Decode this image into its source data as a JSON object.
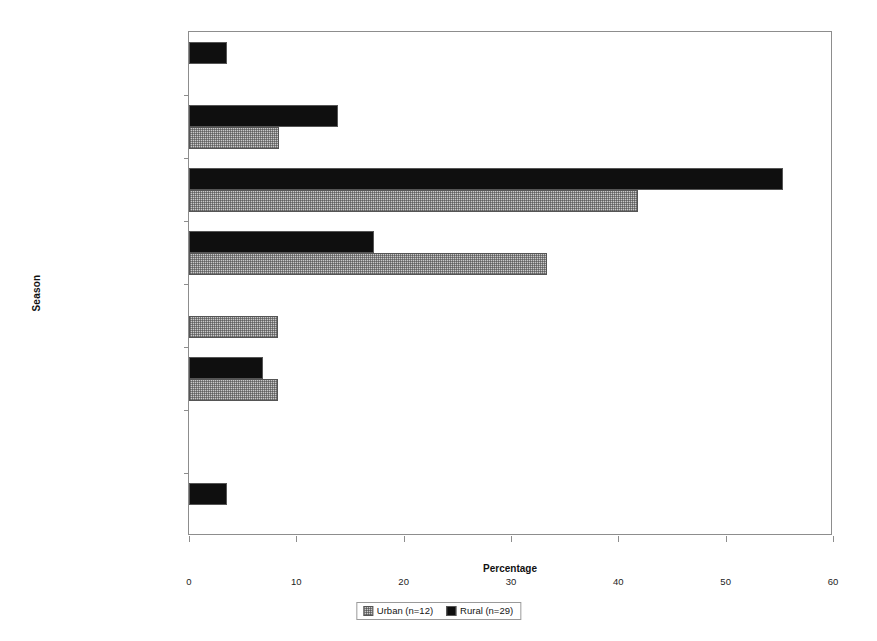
{
  "chart_data": {
    "type": "bar",
    "orientation": "horizontal",
    "title": "",
    "xlabel": "Percentage",
    "ylabel": "Season",
    "xlim": [
      0,
      60
    ],
    "xticks": [
      0,
      10,
      20,
      30,
      40,
      50,
      60
    ],
    "grid": false,
    "legend_position": "bottom-center",
    "categories": [
      "Summer",
      "Late summer/early fall",
      "Fall",
      "Late fall/early winter",
      "Winter",
      "Late winter/early spring",
      "Spring",
      "Late spring/early summer"
    ],
    "series": [
      {
        "name": "Urban (n=12)",
        "color": "#c9c9c9",
        "fill": "cross-hatch",
        "values": [
          0,
          8.4,
          41.8,
          33.4,
          8.3,
          8.3,
          0,
          0
        ]
      },
      {
        "name": "Rural (n=29)",
        "color": "#0f0f0f",
        "fill": "solid",
        "values": [
          3.5,
          13.9,
          55.3,
          17.2,
          0,
          6.9,
          0,
          3.5
        ]
      }
    ]
  },
  "legend": {
    "entries": [
      {
        "label": "Urban (n=12)",
        "swatch": "urban-hatch-swatch"
      },
      {
        "label": "Rural (n=29)",
        "swatch": "rural-black-swatch"
      }
    ]
  },
  "axis": {
    "x_title": "Percentage",
    "y_title": "Season",
    "x_tick_labels": [
      "0",
      "10",
      "20",
      "30",
      "40",
      "50",
      "60"
    ]
  }
}
